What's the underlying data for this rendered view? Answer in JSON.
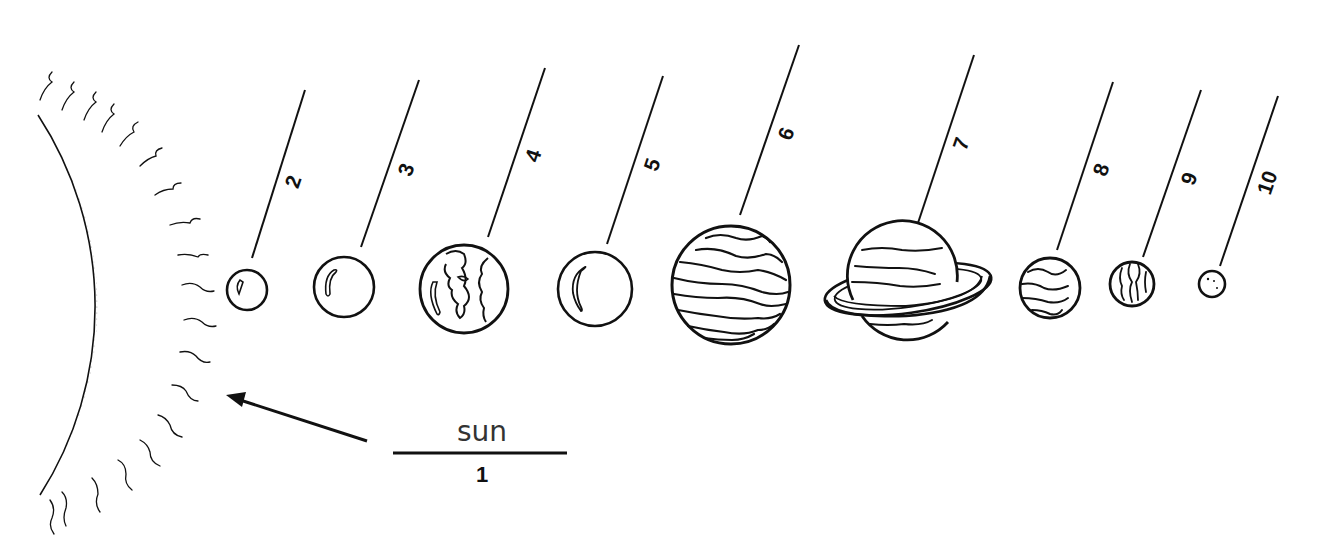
{
  "diagram": {
    "colors": {
      "ink": "#111111",
      "background": "#ffffff",
      "stipple": "#555555"
    },
    "sun": {
      "word_label": "sun",
      "number_label": "1",
      "arrow": {
        "from": [
          367,
          441
        ],
        "to": [
          228,
          396
        ]
      },
      "answer_line": {
        "x1": 393,
        "x2": 567,
        "y": 453
      }
    },
    "planets": [
      {
        "number": "2",
        "kind": "small-rocky",
        "cx": 247,
        "cy": 290,
        "r": 20
      },
      {
        "number": "3",
        "kind": "plain-sphere",
        "cx": 344,
        "cy": 287,
        "r": 30
      },
      {
        "number": "4",
        "kind": "earth-like",
        "cx": 464,
        "cy": 289,
        "r": 44
      },
      {
        "number": "5",
        "kind": "plain-sphere",
        "cx": 595,
        "cy": 289,
        "r": 37
      },
      {
        "number": "6",
        "kind": "banded-giant",
        "cx": 731,
        "cy": 285,
        "r": 59
      },
      {
        "number": "7",
        "kind": "ringed-giant",
        "cx": 900,
        "cy": 285,
        "r": 55
      },
      {
        "number": "8",
        "kind": "banded-medium",
        "cx": 1050,
        "cy": 288,
        "r": 30
      },
      {
        "number": "9",
        "kind": "banded-small",
        "cx": 1132,
        "cy": 284,
        "r": 22
      },
      {
        "number": "10",
        "kind": "tiny-dwarf",
        "cx": 1212,
        "cy": 284,
        "r": 13
      }
    ],
    "label_lines": [
      {
        "number": "2",
        "x1": 252,
        "y1": 258,
        "x2": 305,
        "y2": 90,
        "label_x": 300,
        "label_y": 184
      },
      {
        "number": "3",
        "x1": 361,
        "y1": 247,
        "x2": 419,
        "y2": 80,
        "label_x": 413,
        "label_y": 172
      },
      {
        "number": "4",
        "x1": 488,
        "y1": 237,
        "x2": 545,
        "y2": 68,
        "label_x": 540,
        "label_y": 158
      },
      {
        "number": "5",
        "x1": 607,
        "y1": 244,
        "x2": 663,
        "y2": 76,
        "label_x": 659,
        "label_y": 167
      },
      {
        "number": "6",
        "x1": 740,
        "y1": 215,
        "x2": 799,
        "y2": 45,
        "label_x": 793,
        "label_y": 136
      },
      {
        "number": "7",
        "x1": 918,
        "y1": 223,
        "x2": 974,
        "y2": 55,
        "label_x": 968,
        "label_y": 146
      },
      {
        "number": "8",
        "x1": 1057,
        "y1": 250,
        "x2": 1113,
        "y2": 82,
        "label_x": 1108,
        "label_y": 172
      },
      {
        "number": "9",
        "x1": 1143,
        "y1": 257,
        "x2": 1201,
        "y2": 90,
        "label_x": 1196,
        "label_y": 181
      },
      {
        "number": "10",
        "x1": 1220,
        "y1": 266,
        "x2": 1278,
        "y2": 96,
        "label_x": 1274,
        "label_y": 185
      }
    ]
  }
}
